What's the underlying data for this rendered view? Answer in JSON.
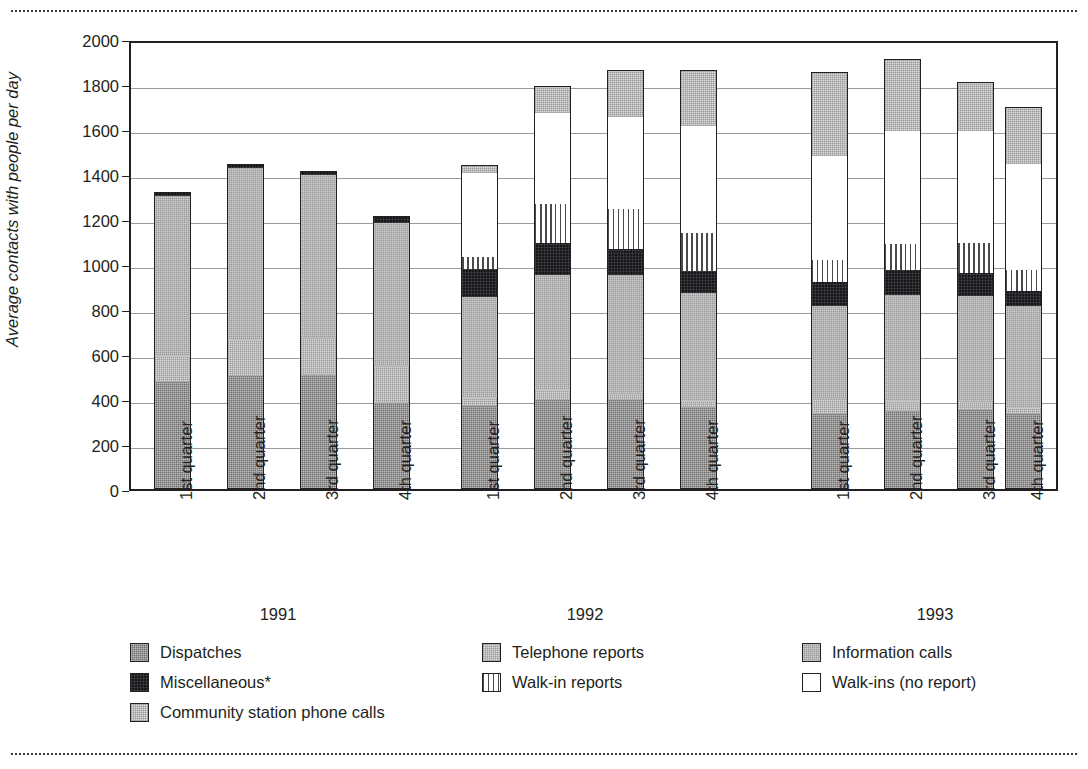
{
  "figure": {
    "y_axis_title": "Average contacts with people per day",
    "y_ticks": [
      "0",
      "200",
      "400",
      "600",
      "800",
      "1000",
      "1200",
      "1400",
      "1600",
      "1800",
      "2000"
    ],
    "group_labels": [
      "1991",
      "1992",
      "1993"
    ],
    "quarter_labels": [
      "1st quarter",
      "2nd quarter",
      "3rd quarter",
      "4th quarter"
    ]
  },
  "legend": {
    "columns": [
      [
        {
          "label": "Dispatches",
          "key": "dispatches",
          "swatch": "medium-dark-gray-checkered"
        },
        {
          "label": "Miscellaneous*",
          "key": "misc",
          "swatch": "black"
        },
        {
          "label": "Community station phone calls",
          "key": "community",
          "swatch": "very-light-gray-stippled"
        }
      ],
      [
        {
          "label": "Telephone reports",
          "key": "telephone",
          "swatch": "light-gray-stippled"
        },
        {
          "label": "Walk-in reports",
          "key": "walkinrep",
          "swatch": "vertical-stripes"
        }
      ],
      [
        {
          "label": "Information calls",
          "key": "information",
          "swatch": "gray-checkered"
        },
        {
          "label": "Walk-ins (no report)",
          "key": "walkins",
          "swatch": "white"
        }
      ]
    ]
  },
  "colors": {
    "dispatches": "#6d6d6d",
    "telephone": "#d9d9d9",
    "information": "#9a9a9a",
    "misc": "#17161a",
    "walkinrep": "#ffffff",
    "walkins": "#ffffff",
    "community": "#dcdcdc",
    "frame": "#231f20",
    "grid": "#9b9b9b"
  },
  "chart_data": {
    "type": "bar",
    "title": "",
    "subtitle": "",
    "xlabel": "",
    "ylabel": "Average contacts with people per day",
    "ylim": [
      0,
      2000
    ],
    "ytick_step": 200,
    "grid": true,
    "stacked": true,
    "legend_position": "bottom",
    "footnote": "*",
    "categories": [
      "1991 1st quarter",
      "1991 2nd quarter",
      "1991 3rd quarter",
      "1991 4th quarter",
      "1992 1st quarter",
      "1992 2nd quarter",
      "1992 3rd quarter",
      "1992 4th quarter",
      "1993 1st quarter",
      "1993 2nd quarter",
      "1993 3rd quarter",
      "1993 4th quarter"
    ],
    "series": [
      {
        "name": "Dispatches",
        "values": [
          480,
          505,
          510,
          385,
          375,
          400,
          400,
          370,
          340,
          350,
          355,
          340
        ]
      },
      {
        "name": "Telephone reports",
        "values": [
          120,
          165,
          170,
          170,
          40,
          50,
          35,
          30,
          70,
          50,
          45,
          30
        ]
      },
      {
        "name": "Information calls",
        "values": [
          715,
          770,
          730,
          640,
          450,
          515,
          530,
          485,
          415,
          475,
          470,
          455
        ]
      },
      {
        "name": "Miscellaneous*",
        "values": [
          20,
          20,
          15,
          30,
          130,
          145,
          120,
          100,
          115,
          115,
          110,
          75
        ]
      },
      {
        "name": "Walk-in reports",
        "values": [
          0,
          0,
          0,
          0,
          60,
          180,
          180,
          175,
          100,
          120,
          135,
          95
        ]
      },
      {
        "name": "Walk-ins (no report)",
        "values": [
          0,
          0,
          0,
          0,
          375,
          410,
          415,
          480,
          465,
          510,
          505,
          475
        ]
      },
      {
        "name": "Community station phone calls",
        "values": [
          0,
          0,
          0,
          0,
          35,
          120,
          210,
          250,
          375,
          320,
          215,
          255
        ]
      }
    ],
    "totals": [
      1335,
      1460,
      1425,
      1225,
      1465,
      1820,
      1890,
      1890,
      1880,
      1940,
      1845,
      1725
    ]
  },
  "bar_geometry": {
    "segment_order": [
      "dispatches",
      "telephone",
      "information",
      "misc",
      "walkinrep",
      "walkins",
      "community"
    ],
    "bar_left_px": [
      152,
      225,
      298,
      371,
      459,
      532,
      605,
      678,
      809,
      882,
      955,
      1003
    ],
    "bar_width_px": 37,
    "group_label_center_px": [
      278,
      585,
      935
    ]
  }
}
